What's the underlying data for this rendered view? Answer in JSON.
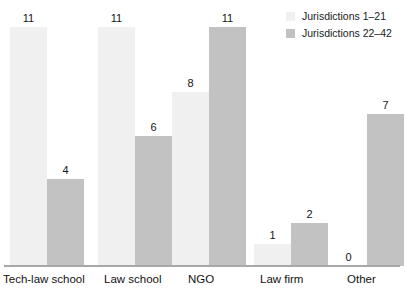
{
  "chart_data": {
    "type": "bar",
    "title": "",
    "subtitle": "",
    "xlabel": "",
    "ylabel": "",
    "ylim": [
      0,
      11
    ],
    "grid": false,
    "legend_position": "top-right",
    "categories": [
      "Tech-law school",
      "Law school",
      "NGO",
      "Law firm",
      "Other"
    ],
    "series": [
      {
        "name": "Jurisdictions 1–21",
        "color": "#f0f0f0",
        "values": [
          11,
          11,
          8,
          1,
          0
        ]
      },
      {
        "name": "Jurisdictions 22–42",
        "color": "#c2c2c2",
        "values": [
          4,
          6,
          11,
          2,
          7
        ]
      }
    ],
    "value_labels": [
      [
        "11",
        "4"
      ],
      [
        "11",
        "6"
      ],
      [
        "8",
        "11"
      ],
      [
        "1",
        "2"
      ],
      [
        "0",
        "7"
      ]
    ]
  },
  "legend": {
    "items": [
      {
        "label": "Jurisdictions 1–21",
        "color": "#f0f0f0"
      },
      {
        "label": "Jurisdictions 22–42",
        "color": "#c2c2c2"
      }
    ]
  },
  "axis": {
    "baseline_color": "#a8a8a8"
  },
  "colors": {
    "series_light": "#f0f0f0",
    "series_dark": "#c2c2c2",
    "text": "#141414",
    "background": "#ffffff"
  }
}
